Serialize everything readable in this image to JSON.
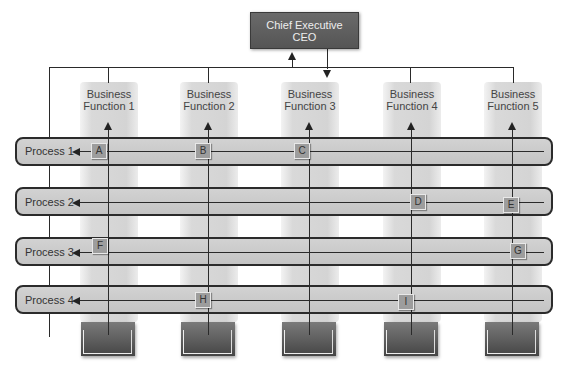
{
  "ceo": {
    "line1": "Chief Executive",
    "line2": "CEO"
  },
  "functions": [
    {
      "line1": "Business",
      "line2": "Function 1"
    },
    {
      "line1": "Business",
      "line2": "Function 2"
    },
    {
      "line1": "Business",
      "line2": "Function 3"
    },
    {
      "line1": "Business",
      "line2": "Function 4"
    },
    {
      "line1": "Business",
      "line2": "Function 5"
    }
  ],
  "processes": [
    {
      "label": "Process 1"
    },
    {
      "label": "Process 2"
    },
    {
      "label": "Process 3"
    },
    {
      "label": "Process 4"
    }
  ],
  "badges": {
    "A": "A",
    "B": "B",
    "C": "C",
    "D": "D",
    "E": "E",
    "F": "F",
    "G": "G",
    "H": "H",
    "I": "I"
  }
}
